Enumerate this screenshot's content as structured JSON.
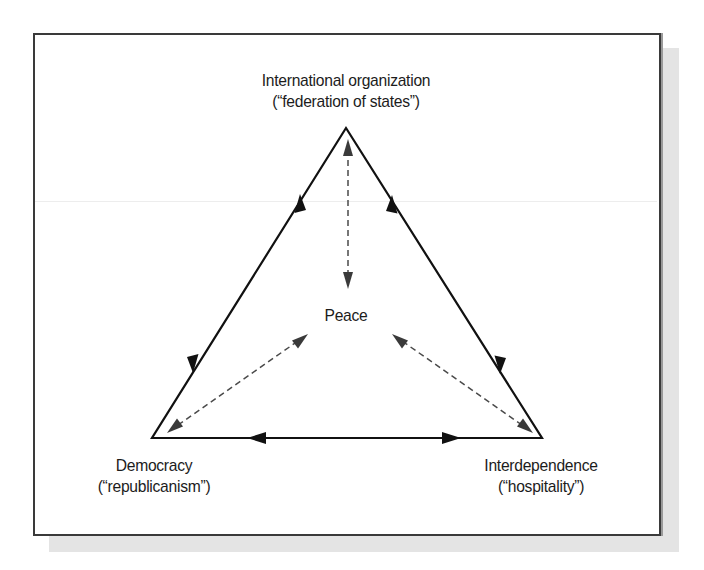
{
  "diagram": {
    "nodes": {
      "top": {
        "line1": "International organization",
        "line2": "(“federation of states”)"
      },
      "left": {
        "line1": "Democracy",
        "line2": "(“republicanism”)"
      },
      "right": {
        "line1": "Interdependence",
        "line2": "(“hospitality”)"
      },
      "center": {
        "label": "Peace"
      }
    },
    "edges": [
      {
        "from": "left",
        "to": "top",
        "style": "solid",
        "direction": "bidirectional"
      },
      {
        "from": "top",
        "to": "right",
        "style": "solid",
        "direction": "bidirectional"
      },
      {
        "from": "left",
        "to": "right",
        "style": "solid",
        "direction": "bidirectional"
      },
      {
        "from": "top",
        "to": "center",
        "style": "dashed",
        "direction": "bidirectional"
      },
      {
        "from": "left",
        "to": "center",
        "style": "dashed",
        "direction": "bidirectional"
      },
      {
        "from": "right",
        "to": "center",
        "style": "dashed",
        "direction": "bidirectional"
      }
    ],
    "colors": {
      "solid_line": "#111111",
      "dashed_line": "#4a4a4a",
      "shadow": "#e4e4e4",
      "border": "#3a3a3a"
    }
  }
}
